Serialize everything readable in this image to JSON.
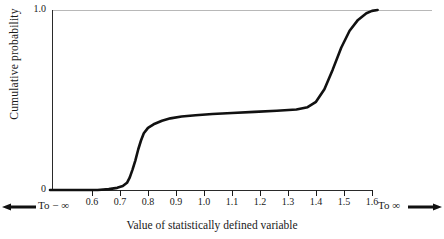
{
  "chart_data": {
    "type": "line",
    "title": "",
    "xlabel": "Value of statistically defined variable",
    "ylabel": "Cumulative probability",
    "xlim": [
      0.45,
      1.7
    ],
    "ylim": [
      0,
      1.0
    ],
    "grid": false,
    "legend": null,
    "x_ticks": [
      "0.6",
      "0.7",
      "0.8",
      "0.9",
      "1.0",
      "1.1",
      "1.2",
      "1.3",
      "1.4",
      "1.5",
      "1.6"
    ],
    "x_tick_values": [
      0.6,
      0.7,
      0.8,
      0.9,
      1.0,
      1.1,
      1.2,
      1.3,
      1.4,
      1.5,
      1.6
    ],
    "y_ticks": [
      "0",
      "1.0"
    ],
    "y_tick_values": [
      0,
      1.0
    ],
    "axis_left_label": "To − ∞",
    "axis_right_label": "To ∞",
    "left_arrow_icon": "arrow-left-icon",
    "right_arrow_icon": "arrow-right-icon",
    "series": [
      {
        "name": "Cumulative probability",
        "color": "#111111",
        "x": [
          0.45,
          0.55,
          0.62,
          0.66,
          0.69,
          0.71,
          0.725,
          0.735,
          0.745,
          0.755,
          0.765,
          0.775,
          0.785,
          0.8,
          0.82,
          0.85,
          0.88,
          0.92,
          0.97,
          1.03,
          1.1,
          1.18,
          1.26,
          1.33,
          1.37,
          1.4,
          1.43,
          1.46,
          1.49,
          1.52,
          1.55,
          1.58,
          1.6,
          1.62
        ],
        "y": [
          0.0,
          0.0,
          0.0,
          0.005,
          0.012,
          0.022,
          0.04,
          0.07,
          0.115,
          0.165,
          0.225,
          0.275,
          0.315,
          0.345,
          0.365,
          0.385,
          0.398,
          0.408,
          0.415,
          0.422,
          0.428,
          0.434,
          0.44,
          0.447,
          0.46,
          0.49,
          0.56,
          0.67,
          0.79,
          0.885,
          0.945,
          0.982,
          0.995,
          1.0
        ]
      }
    ]
  },
  "axes": {
    "y_top_label": "1.0",
    "y_bottom_label": "0",
    "y_axis_title": "Cumulative probability",
    "x_axis_title": "Value of statistically defined variable",
    "x_tick_labels": [
      "0.6",
      "0.7",
      "0.8",
      "0.9",
      "1.0",
      "1.1",
      "1.2",
      "1.3",
      "1.4",
      "1.5",
      "1.6"
    ],
    "left_end_label": "To − ∞",
    "right_end_label": "To ∞"
  },
  "colors": {
    "curve": "#111111",
    "axis": "#2a2a2a",
    "top_rule": "#b8b8b8",
    "text": "#1a1a1a",
    "background": "#ffffff"
  }
}
